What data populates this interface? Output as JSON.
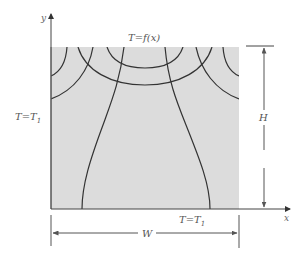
{
  "diagram": {
    "axes": {
      "x_label": "x",
      "y_label": "y"
    },
    "boundaries": {
      "top": {
        "label_main": "T=f",
        "label_arg": "(x)"
      },
      "left": {
        "label_main": "T=T",
        "label_sub": "1"
      },
      "right": {
        "label_main": "T=T",
        "label_sub": "1"
      },
      "bottom": {
        "label_main": "T=T",
        "label_sub": "1"
      }
    },
    "dimensions": {
      "height_label": "H",
      "width_label": "W"
    },
    "colors": {
      "region_fill": "#dcdcdc",
      "curve_stroke": "#333333",
      "axis_stroke": "#444444",
      "dimension_stroke": "#555555"
    }
  }
}
